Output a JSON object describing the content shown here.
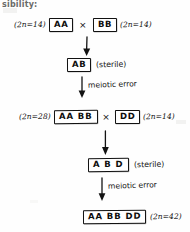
{
  "page": {
    "header_fragment": "sibility:",
    "background_color": "#fefefe",
    "ink_color": "#131313"
  },
  "diagram": {
    "type": "flow-diagram",
    "cross_symbol": "×",
    "rows": [
      {
        "id": "row-1",
        "left_count": "(2n=14)",
        "left_genotype": "AA",
        "cross": "×",
        "right_genotype": "BB",
        "right_count": "(2n=14)"
      },
      {
        "id": "row-2",
        "genotype": "AB",
        "note": "(sterile)"
      },
      {
        "id": "row-3",
        "left_count": "(2n=28)",
        "left_genotype": "AA BB",
        "cross": "×",
        "right_genotype": "DD",
        "right_count": "(2n=14)"
      },
      {
        "id": "row-4",
        "genotype": "A B D",
        "note": "(sterile)"
      },
      {
        "id": "row-5",
        "genotype": "AA BB DD",
        "count": "(2n=42)"
      }
    ],
    "arrows": [
      {
        "id": "arrow-1",
        "label": ""
      },
      {
        "id": "arrow-2",
        "label": "meiotic error"
      },
      {
        "id": "arrow-3",
        "label": ""
      },
      {
        "id": "arrow-4",
        "label": "meiotic error"
      }
    ]
  }
}
